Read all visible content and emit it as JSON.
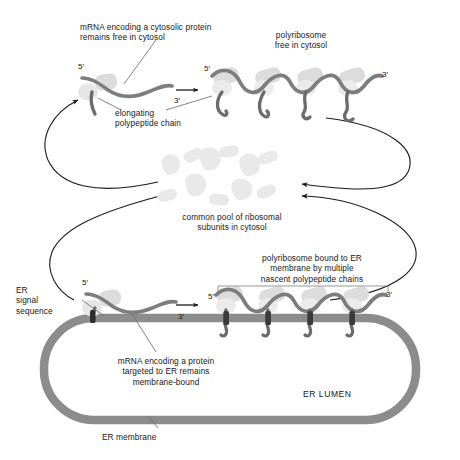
{
  "figure": {
    "background_color": "#ffffff"
  },
  "palette": {
    "mrna_strand": "#7d7d7d",
    "polypeptide": "#6b6b6b",
    "ribosome_light": "#d8d8d8",
    "ribosome_pale": "#e6e6e6",
    "subunit_pool": "#e9e9e9",
    "er_membrane": "#8c8c8c",
    "translocon": "#3b3b3b",
    "signal_sequence": "#2e2e2e",
    "arrow": "#1a1a1a",
    "leader_line": "#6e6e6e",
    "text": "#161616"
  },
  "labels": {
    "free_mrna": "mRNA encoding a cytosolic protein\nremains free in cytosol",
    "free_polyribosome": "polyribosome\nfree in cytosol",
    "elongating_chain": "elongating\npolypeptide chain",
    "subunit_pool": "common pool of ribosomal\nsubunits in cytosol",
    "er_bound_polyribosome": "polyribosome bound to ER\nmembrane by multiple\nnascent polypeptide chains",
    "er_signal_sequence": "ER\nsignal\nsequence",
    "bound_mrna": "mRNA encoding a protein\ntargeted to ER remains\nmembrane-bound",
    "er_lumen": "ER LUMEN",
    "er_membrane": "ER membrane"
  },
  "primes": {
    "free_single_five": "5′",
    "free_single_three": "3′",
    "free_poly_five": "5′",
    "free_poly_three": "3′",
    "bound_single_five": "5′",
    "bound_single_three": "3′",
    "bound_poly_five": "5′",
    "bound_poly_three": "3′"
  },
  "structures": {
    "free_single_ribosome_count": 1,
    "free_polyribosome_ribosome_count": 4,
    "bound_single_ribosome_count": 1,
    "bound_polyribosome_ribosome_count": 4,
    "pool_large_subunits": 5,
    "pool_small_subunits": 6,
    "translocon_count": 4,
    "recycling_arrows": 4,
    "progression_arrows": 2
  }
}
